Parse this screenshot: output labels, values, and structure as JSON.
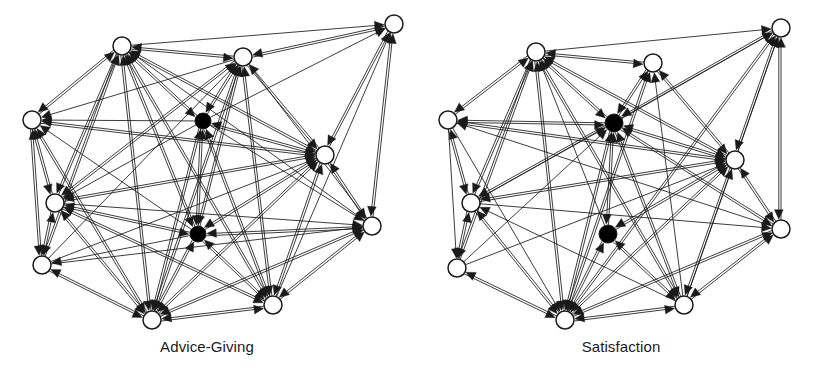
{
  "figure": {
    "background_color": "#ffffff",
    "edge_color": "#1a1a1a",
    "node_outline_color": "#1a1a1a",
    "node_hollow_fill": "#ffffff",
    "node_solid_fill": "#000000"
  },
  "panels": [
    {
      "id": "advice-giving",
      "caption": "Advice-Giving",
      "node_radius_hollow": 9,
      "node_radius_solid": 8,
      "nodes": [
        {
          "id": "A1",
          "label": "A1",
          "x": 122,
          "y": 46,
          "type": "hollow"
        },
        {
          "id": "A2",
          "label": "A2",
          "x": 243,
          "y": 57,
          "type": "hollow"
        },
        {
          "id": "A3",
          "label": "A3",
          "x": 394,
          "y": 24,
          "type": "hollow"
        },
        {
          "id": "A4",
          "label": "A4",
          "x": 32,
          "y": 120,
          "type": "hollow"
        },
        {
          "id": "A5",
          "label": "A5",
          "x": 203,
          "y": 121,
          "type": "solid"
        },
        {
          "id": "A6",
          "label": "A6",
          "x": 325,
          "y": 155,
          "type": "hollow"
        },
        {
          "id": "A7",
          "label": "A7",
          "x": 55,
          "y": 203,
          "type": "hollow"
        },
        {
          "id": "A8",
          "label": "A8",
          "x": 198,
          "y": 234,
          "type": "solid"
        },
        {
          "id": "A9",
          "label": "A9",
          "x": 372,
          "y": 226,
          "type": "hollow"
        },
        {
          "id": "A10",
          "label": "A10",
          "x": 42,
          "y": 265,
          "type": "hollow"
        },
        {
          "id": "A11",
          "label": "A11",
          "x": 152,
          "y": 320,
          "type": "hollow"
        },
        {
          "id": "A12",
          "label": "A12",
          "x": 273,
          "y": 305,
          "type": "hollow"
        }
      ],
      "edges": [
        {
          "from": "A2",
          "to": "A1"
        },
        {
          "from": "A4",
          "to": "A1"
        },
        {
          "from": "A5",
          "to": "A1"
        },
        {
          "from": "A6",
          "to": "A1"
        },
        {
          "from": "A7",
          "to": "A1"
        },
        {
          "from": "A8",
          "to": "A1"
        },
        {
          "from": "A10",
          "to": "A1"
        },
        {
          "from": "A11",
          "to": "A1"
        },
        {
          "from": "A12",
          "to": "A1"
        },
        {
          "from": "A9",
          "to": "A1"
        },
        {
          "from": "A1",
          "to": "A2"
        },
        {
          "from": "A3",
          "to": "A2"
        },
        {
          "from": "A5",
          "to": "A2"
        },
        {
          "from": "A6",
          "to": "A2"
        },
        {
          "from": "A7",
          "to": "A2"
        },
        {
          "from": "A8",
          "to": "A2"
        },
        {
          "from": "A10",
          "to": "A2"
        },
        {
          "from": "A11",
          "to": "A2"
        },
        {
          "from": "A12",
          "to": "A2"
        },
        {
          "from": "A1",
          "to": "A3"
        },
        {
          "from": "A2",
          "to": "A3"
        },
        {
          "from": "A6",
          "to": "A3"
        },
        {
          "from": "A9",
          "to": "A3"
        },
        {
          "from": "A5",
          "to": "A3"
        },
        {
          "from": "A12",
          "to": "A3"
        },
        {
          "from": "A1",
          "to": "A4"
        },
        {
          "from": "A2",
          "to": "A4"
        },
        {
          "from": "A5",
          "to": "A4"
        },
        {
          "from": "A6",
          "to": "A4"
        },
        {
          "from": "A7",
          "to": "A4"
        },
        {
          "from": "A8",
          "to": "A4"
        },
        {
          "from": "A10",
          "to": "A4"
        },
        {
          "from": "A11",
          "to": "A4"
        },
        {
          "from": "A1",
          "to": "A5"
        },
        {
          "from": "A2",
          "to": "A5"
        },
        {
          "from": "A6",
          "to": "A5"
        },
        {
          "from": "A8",
          "to": "A5"
        },
        {
          "from": "A11",
          "to": "A5"
        },
        {
          "from": "A12",
          "to": "A5"
        },
        {
          "from": "A1",
          "to": "A6"
        },
        {
          "from": "A2",
          "to": "A6"
        },
        {
          "from": "A3",
          "to": "A6"
        },
        {
          "from": "A4",
          "to": "A6"
        },
        {
          "from": "A5",
          "to": "A6"
        },
        {
          "from": "A7",
          "to": "A6"
        },
        {
          "from": "A8",
          "to": "A6"
        },
        {
          "from": "A9",
          "to": "A6"
        },
        {
          "from": "A10",
          "to": "A6"
        },
        {
          "from": "A11",
          "to": "A6"
        },
        {
          "from": "A12",
          "to": "A6"
        },
        {
          "from": "A1",
          "to": "A7"
        },
        {
          "from": "A2",
          "to": "A7"
        },
        {
          "from": "A4",
          "to": "A7"
        },
        {
          "from": "A5",
          "to": "A7"
        },
        {
          "from": "A6",
          "to": "A7"
        },
        {
          "from": "A8",
          "to": "A7"
        },
        {
          "from": "A10",
          "to": "A7"
        },
        {
          "from": "A11",
          "to": "A7"
        },
        {
          "from": "A12",
          "to": "A7"
        },
        {
          "from": "A1",
          "to": "A8"
        },
        {
          "from": "A2",
          "to": "A8"
        },
        {
          "from": "A5",
          "to": "A8"
        },
        {
          "from": "A6",
          "to": "A8"
        },
        {
          "from": "A7",
          "to": "A8"
        },
        {
          "from": "A9",
          "to": "A8"
        },
        {
          "from": "A11",
          "to": "A8"
        },
        {
          "from": "A12",
          "to": "A8"
        },
        {
          "from": "A2",
          "to": "A9"
        },
        {
          "from": "A3",
          "to": "A9"
        },
        {
          "from": "A5",
          "to": "A9"
        },
        {
          "from": "A6",
          "to": "A9"
        },
        {
          "from": "A7",
          "to": "A9"
        },
        {
          "from": "A8",
          "to": "A9"
        },
        {
          "from": "A10",
          "to": "A9"
        },
        {
          "from": "A11",
          "to": "A9"
        },
        {
          "from": "A12",
          "to": "A9"
        },
        {
          "from": "A1",
          "to": "A10"
        },
        {
          "from": "A4",
          "to": "A10"
        },
        {
          "from": "A7",
          "to": "A10"
        },
        {
          "from": "A8",
          "to": "A10"
        },
        {
          "from": "A11",
          "to": "A10"
        },
        {
          "from": "A1",
          "to": "A11"
        },
        {
          "from": "A2",
          "to": "A11"
        },
        {
          "from": "A4",
          "to": "A11"
        },
        {
          "from": "A5",
          "to": "A11"
        },
        {
          "from": "A6",
          "to": "A11"
        },
        {
          "from": "A7",
          "to": "A11"
        },
        {
          "from": "A8",
          "to": "A11"
        },
        {
          "from": "A9",
          "to": "A11"
        },
        {
          "from": "A10",
          "to": "A11"
        },
        {
          "from": "A12",
          "to": "A11"
        },
        {
          "from": "A1",
          "to": "A12"
        },
        {
          "from": "A2",
          "to": "A12"
        },
        {
          "from": "A5",
          "to": "A12"
        },
        {
          "from": "A6",
          "to": "A12"
        },
        {
          "from": "A7",
          "to": "A12"
        },
        {
          "from": "A8",
          "to": "A12"
        },
        {
          "from": "A9",
          "to": "A12"
        },
        {
          "from": "A11",
          "to": "A12"
        }
      ]
    },
    {
      "id": "satisfaction",
      "caption": "Satisfaction",
      "node_radius_hollow": 9,
      "node_radius_solid": 9,
      "nodes": [
        {
          "id": "S1",
          "label": "S1",
          "x": 122,
          "y": 52,
          "type": "hollow"
        },
        {
          "id": "S2",
          "label": "S2",
          "x": 239,
          "y": 63,
          "type": "hollow"
        },
        {
          "id": "S3",
          "label": "S3",
          "x": 367,
          "y": 28,
          "type": "hollow"
        },
        {
          "id": "S4",
          "label": "S4",
          "x": 34,
          "y": 120,
          "type": "hollow"
        },
        {
          "id": "S5",
          "label": "S5",
          "x": 200,
          "y": 123,
          "type": "solid"
        },
        {
          "id": "S6",
          "label": "S6",
          "x": 321,
          "y": 160,
          "type": "hollow"
        },
        {
          "id": "S7",
          "label": "S7",
          "x": 57,
          "y": 203,
          "type": "hollow"
        },
        {
          "id": "S8",
          "label": "S8",
          "x": 194,
          "y": 234,
          "type": "solid"
        },
        {
          "id": "S9",
          "label": "S9",
          "x": 367,
          "y": 229,
          "type": "hollow"
        },
        {
          "id": "S10",
          "label": "S10",
          "x": 43,
          "y": 268,
          "type": "hollow"
        },
        {
          "id": "S11",
          "label": "S11",
          "x": 151,
          "y": 320,
          "type": "hollow"
        },
        {
          "id": "S12",
          "label": "S12",
          "x": 270,
          "y": 305,
          "type": "hollow"
        }
      ],
      "edges": [
        {
          "from": "S2",
          "to": "S1"
        },
        {
          "from": "S4",
          "to": "S1"
        },
        {
          "from": "S5",
          "to": "S1"
        },
        {
          "from": "S6",
          "to": "S1"
        },
        {
          "from": "S7",
          "to": "S1"
        },
        {
          "from": "S8",
          "to": "S1"
        },
        {
          "from": "S10",
          "to": "S1"
        },
        {
          "from": "S11",
          "to": "S1"
        },
        {
          "from": "S12",
          "to": "S1"
        },
        {
          "from": "S1",
          "to": "S2"
        },
        {
          "from": "S5",
          "to": "S2"
        },
        {
          "from": "S6",
          "to": "S2"
        },
        {
          "from": "S11",
          "to": "S2"
        },
        {
          "from": "S12",
          "to": "S2"
        },
        {
          "from": "S1",
          "to": "S3"
        },
        {
          "from": "S5",
          "to": "S3"
        },
        {
          "from": "S6",
          "to": "S3"
        },
        {
          "from": "S7",
          "to": "S3"
        },
        {
          "from": "S9",
          "to": "S3"
        },
        {
          "from": "S11",
          "to": "S3"
        },
        {
          "from": "S12",
          "to": "S3"
        },
        {
          "from": "S1",
          "to": "S4"
        },
        {
          "from": "S5",
          "to": "S4"
        },
        {
          "from": "S6",
          "to": "S4"
        },
        {
          "from": "S7",
          "to": "S4"
        },
        {
          "from": "S9",
          "to": "S4"
        },
        {
          "from": "S1",
          "to": "S5"
        },
        {
          "from": "S2",
          "to": "S5"
        },
        {
          "from": "S3",
          "to": "S5"
        },
        {
          "from": "S4",
          "to": "S5"
        },
        {
          "from": "S6",
          "to": "S5"
        },
        {
          "from": "S7",
          "to": "S5"
        },
        {
          "from": "S8",
          "to": "S5"
        },
        {
          "from": "S9",
          "to": "S5"
        },
        {
          "from": "S10",
          "to": "S5"
        },
        {
          "from": "S11",
          "to": "S5"
        },
        {
          "from": "S12",
          "to": "S5"
        },
        {
          "from": "S1",
          "to": "S6"
        },
        {
          "from": "S2",
          "to": "S6"
        },
        {
          "from": "S3",
          "to": "S6"
        },
        {
          "from": "S4",
          "to": "S6"
        },
        {
          "from": "S5",
          "to": "S6"
        },
        {
          "from": "S7",
          "to": "S6"
        },
        {
          "from": "S8",
          "to": "S6"
        },
        {
          "from": "S9",
          "to": "S6"
        },
        {
          "from": "S10",
          "to": "S6"
        },
        {
          "from": "S11",
          "to": "S6"
        },
        {
          "from": "S12",
          "to": "S6"
        },
        {
          "from": "S1",
          "to": "S7"
        },
        {
          "from": "S4",
          "to": "S7"
        },
        {
          "from": "S5",
          "to": "S7"
        },
        {
          "from": "S6",
          "to": "S7"
        },
        {
          "from": "S10",
          "to": "S7"
        },
        {
          "from": "S11",
          "to": "S7"
        },
        {
          "from": "S12",
          "to": "S7"
        },
        {
          "from": "S5",
          "to": "S8"
        },
        {
          "from": "S6",
          "to": "S8"
        },
        {
          "from": "S11",
          "to": "S8"
        },
        {
          "from": "S12",
          "to": "S8"
        },
        {
          "from": "S3",
          "to": "S9"
        },
        {
          "from": "S5",
          "to": "S9"
        },
        {
          "from": "S6",
          "to": "S9"
        },
        {
          "from": "S7",
          "to": "S9"
        },
        {
          "from": "S11",
          "to": "S9"
        },
        {
          "from": "S12",
          "to": "S9"
        },
        {
          "from": "S1",
          "to": "S10"
        },
        {
          "from": "S4",
          "to": "S10"
        },
        {
          "from": "S7",
          "to": "S10"
        },
        {
          "from": "S11",
          "to": "S10"
        },
        {
          "from": "S1",
          "to": "S11"
        },
        {
          "from": "S2",
          "to": "S11"
        },
        {
          "from": "S3",
          "to": "S11"
        },
        {
          "from": "S4",
          "to": "S11"
        },
        {
          "from": "S5",
          "to": "S11"
        },
        {
          "from": "S6",
          "to": "S11"
        },
        {
          "from": "S7",
          "to": "S11"
        },
        {
          "from": "S8",
          "to": "S11"
        },
        {
          "from": "S9",
          "to": "S11"
        },
        {
          "from": "S10",
          "to": "S11"
        },
        {
          "from": "S12",
          "to": "S11"
        },
        {
          "from": "S1",
          "to": "S12"
        },
        {
          "from": "S5",
          "to": "S12"
        },
        {
          "from": "S6",
          "to": "S12"
        },
        {
          "from": "S8",
          "to": "S12"
        },
        {
          "from": "S9",
          "to": "S12"
        },
        {
          "from": "S11",
          "to": "S12"
        }
      ]
    }
  ]
}
